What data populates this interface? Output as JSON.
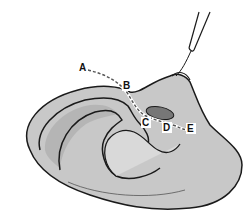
{
  "diagram": {
    "labels": [
      {
        "id": "A",
        "text": "A",
        "x": 82,
        "y": 72
      },
      {
        "id": "B",
        "text": "B",
        "x": 126,
        "y": 89
      },
      {
        "id": "C",
        "text": "C",
        "x": 145,
        "y": 126
      },
      {
        "id": "D",
        "text": "D",
        "x": 166,
        "y": 131
      },
      {
        "id": "E",
        "text": "E",
        "x": 191,
        "y": 132
      }
    ],
    "colors": {
      "skin": "#c8c8c8",
      "skin_light": "#d9d9d9",
      "shadow": "#a9a9a9",
      "outline": "#1a1a1a",
      "dashed_line": "#555555"
    }
  }
}
